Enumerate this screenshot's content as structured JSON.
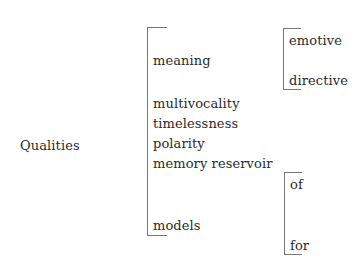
{
  "root": {
    "label": "Qualities"
  },
  "qualities": [
    {
      "label": "meaning"
    },
    {
      "label": "multivocality"
    },
    {
      "label": "timelessness"
    },
    {
      "label": "polarity"
    },
    {
      "label": "memory reservoir"
    },
    {
      "label": "models"
    }
  ],
  "meaning_types": [
    {
      "label": "emotive"
    },
    {
      "label": "directive"
    }
  ],
  "model_types": [
    {
      "label": "of"
    },
    {
      "label": "for"
    }
  ],
  "colors": {
    "text": "#2a2a2a",
    "bracket": "#777777",
    "background": "#ffffff"
  }
}
